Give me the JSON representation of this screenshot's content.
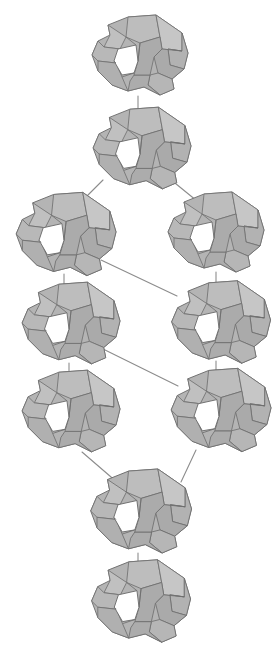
{
  "figure": {
    "title": "",
    "caption": "",
    "background_color": "#ffffff",
    "width": 276,
    "height": 659
  },
  "style": {
    "node_fill": "#b0b0b0",
    "node_fill_light": "#c2c2c2",
    "node_fill_dark": "#a0a0a0",
    "node_stroke": "#6b6b6b",
    "edge_color": "#8c8c8c",
    "edge_width": 1.1,
    "hole_fill": "#ffffff"
  },
  "graph": {
    "type": "diagram",
    "layout": "diamond-lattice",
    "node_count": 10,
    "edge_count": 10,
    "node_glyph": "polyhedral-rock",
    "rows": [
      {
        "index": 0,
        "y": 55,
        "nodes": [
          "n0"
        ]
      },
      {
        "index": 1,
        "y": 148,
        "nodes": [
          "n1"
        ]
      },
      {
        "index": 2,
        "y": 233,
        "nodes": [
          "n2",
          "n3"
        ]
      },
      {
        "index": 3,
        "y": 323,
        "nodes": [
          "n4",
          "n5"
        ]
      },
      {
        "index": 4,
        "y": 410,
        "nodes": [
          "n6",
          "n7"
        ]
      },
      {
        "index": 5,
        "y": 510,
        "nodes": [
          "n8"
        ]
      },
      {
        "index": 6,
        "y": 600,
        "nodes": [
          "n9"
        ]
      }
    ],
    "nodes": [
      {
        "id": "n0",
        "label": "",
        "x": 138,
        "y": 55,
        "scale": 1.0
      },
      {
        "id": "n1",
        "label": "",
        "x": 140,
        "y": 148,
        "scale": 1.02
      },
      {
        "id": "n2",
        "label": "",
        "x": 64,
        "y": 234,
        "scale": 1.04
      },
      {
        "id": "n3",
        "label": "",
        "x": 214,
        "y": 232,
        "scale": 1.0
      },
      {
        "id": "n4",
        "label": "",
        "x": 69,
        "y": 323,
        "scale": 1.02
      },
      {
        "id": "n5",
        "label": "",
        "x": 219,
        "y": 322,
        "scale": 1.03
      },
      {
        "id": "n6",
        "label": "",
        "x": 69,
        "y": 411,
        "scale": 1.02
      },
      {
        "id": "n7",
        "label": "",
        "x": 219,
        "y": 410,
        "scale": 1.04
      },
      {
        "id": "n8",
        "label": "",
        "x": 139,
        "y": 511,
        "scale": 1.05
      },
      {
        "id": "n9",
        "label": "",
        "x": 139,
        "y": 601,
        "scale": 1.03
      }
    ],
    "edges": [
      {
        "from": "n0",
        "to": "n1",
        "kind": "vertical",
        "x1": 138,
        "y1": 96,
        "x2": 138,
        "y2": 119
      },
      {
        "from": "n1",
        "to": "n2",
        "kind": "diagonal",
        "x1": 103,
        "y1": 180,
        "x2": 82,
        "y2": 201
      },
      {
        "from": "n1",
        "to": "n3",
        "kind": "diagonal",
        "x1": 170,
        "y1": 179,
        "x2": 197,
        "y2": 201
      },
      {
        "from": "n2",
        "to": "n4",
        "kind": "vertical",
        "x1": 64,
        "y1": 274,
        "x2": 64,
        "y2": 292
      },
      {
        "from": "n3",
        "to": "n5",
        "kind": "vertical",
        "x1": 216,
        "y1": 272,
        "x2": 216,
        "y2": 291
      },
      {
        "from": "n2",
        "to": "n5",
        "kind": "diagonal",
        "x1": 101,
        "y1": 260,
        "x2": 177,
        "y2": 296
      },
      {
        "from": "n4",
        "to": "n6",
        "kind": "vertical",
        "x1": 69,
        "y1": 363,
        "x2": 69,
        "y2": 381
      },
      {
        "from": "n5",
        "to": "n7",
        "kind": "vertical",
        "x1": 216,
        "y1": 361,
        "x2": 216,
        "y2": 379
      },
      {
        "from": "n4",
        "to": "n7",
        "kind": "diagonal",
        "x1": 101,
        "y1": 348,
        "x2": 178,
        "y2": 386
      },
      {
        "from": "n6",
        "to": "n8",
        "kind": "diagonal",
        "x1": 82,
        "y1": 452,
        "x2": 118,
        "y2": 483
      },
      {
        "from": "n7",
        "to": "n8",
        "kind": "diagonal",
        "x1": 196,
        "y1": 450,
        "x2": 181,
        "y2": 482
      },
      {
        "from": "n8",
        "to": "n9",
        "kind": "vertical",
        "x1": 138,
        "y1": 553,
        "x2": 138,
        "y2": 572
      }
    ]
  }
}
